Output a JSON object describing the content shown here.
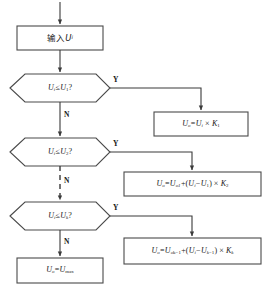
{
  "diagram": {
    "type": "flowchart",
    "title": "",
    "orientation": "top-to-bottom",
    "colors": {
      "stroke": "#4a4a4a",
      "text": "#1a1a1a",
      "background": "#ffffff"
    },
    "nodes": [
      {
        "id": "input",
        "shape": "rectangle",
        "text": "输入Ui",
        "text_parts": {
          "prefix": "输入",
          "var": "U",
          "sub": "i"
        }
      },
      {
        "id": "decision1",
        "shape": "hexagon",
        "text": "Ui≤U1?",
        "text_parts": {
          "lhs": "U",
          "lhs_sub": "i",
          "op": "≤",
          "rhs": "U",
          "rhs_sub": "1",
          "q": "?"
        }
      },
      {
        "id": "decision2",
        "shape": "hexagon",
        "text": "Ui≤U2?",
        "text_parts": {
          "lhs": "U",
          "lhs_sub": "i",
          "op": "≤",
          "rhs": "U",
          "rhs_sub": "2",
          "q": "?"
        }
      },
      {
        "id": "decision3",
        "shape": "hexagon",
        "text": "Ui≤Uk?",
        "text_parts": {
          "lhs": "U",
          "lhs_sub": "i",
          "op": "≤",
          "rhs": "U",
          "rhs_sub": "k",
          "q": "?"
        }
      },
      {
        "id": "result1",
        "shape": "rectangle",
        "text": "Uo=Ui×K1"
      },
      {
        "id": "result2",
        "shape": "rectangle",
        "text": "Uo=Uo1+(Ui−U1)×K2"
      },
      {
        "id": "result3",
        "shape": "rectangle",
        "text": "Uo=Uo(k−1)+(Ui−U(k−1))×Kk"
      },
      {
        "id": "result_max",
        "shape": "rectangle",
        "text": "Uo=Umax"
      }
    ],
    "edge_labels": {
      "yes": "Y",
      "no": "N"
    },
    "edges": [
      {
        "from": "entry",
        "to": "input",
        "label": "",
        "style": "solid"
      },
      {
        "from": "input",
        "to": "decision1",
        "label": "",
        "style": "solid"
      },
      {
        "from": "decision1",
        "to": "result1",
        "label": "Y",
        "style": "solid"
      },
      {
        "from": "decision1",
        "to": "decision2",
        "label": "N",
        "style": "solid"
      },
      {
        "from": "decision2",
        "to": "result2",
        "label": "Y",
        "style": "solid"
      },
      {
        "from": "decision2",
        "to": "decision3",
        "label": "N",
        "style": "dashed"
      },
      {
        "from": "decision3",
        "to": "result3",
        "label": "Y",
        "style": "solid"
      },
      {
        "from": "decision3",
        "to": "result_max",
        "label": "N",
        "style": "solid"
      }
    ]
  }
}
